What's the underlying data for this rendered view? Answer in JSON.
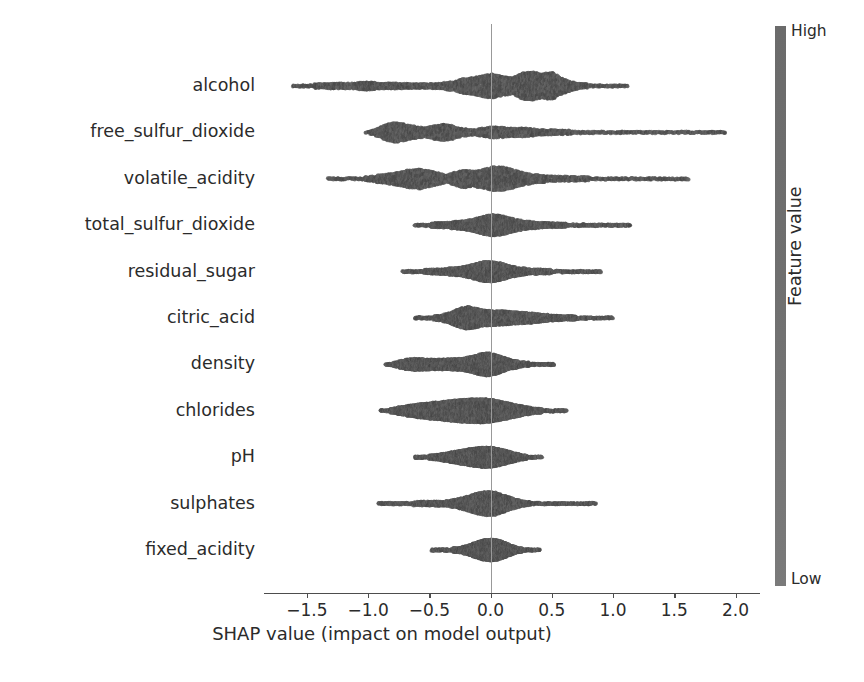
{
  "chart_data": {
    "type": "scatter",
    "plot_variant": "shap-beeswarm",
    "title": "",
    "xlabel": "SHAP value (impact on model output)",
    "ylabel": "",
    "xlim": [
      -1.85,
      2.2
    ],
    "xticks": [
      -1.5,
      -1.0,
      -0.5,
      0.0,
      0.5,
      1.0,
      1.5,
      2.0
    ],
    "xtick_labels": [
      "−1.5",
      "−1.0",
      "−0.5",
      "0.0",
      "0.5",
      "1.0",
      "1.5",
      "2.0"
    ],
    "grid": false,
    "zero_reference_line": 0.0,
    "categories": [
      "alcohol",
      "free_sulfur_dioxide",
      "volatile_acidity",
      "total_sulfur_dioxide",
      "residual_sugar",
      "citric_acid",
      "density",
      "chlorides",
      "pH",
      "sulphates",
      "fixed_acidity"
    ],
    "colorbar": {
      "title": "Feature value",
      "high_label": "High",
      "low_label": "Low",
      "low_color": "#7a7a7a",
      "high_color": "#6b6b6b",
      "position": "right"
    },
    "dot_color": "#595959",
    "series": [
      {
        "name": "alcohol",
        "x_range": [
          -1.62,
          1.12
        ],
        "density_profile": [
          [
            -1.62,
            0.03
          ],
          [
            -1.5,
            0.1
          ],
          [
            -1.38,
            0.17
          ],
          [
            -1.26,
            0.22
          ],
          [
            -1.14,
            0.2
          ],
          [
            -1.02,
            0.26
          ],
          [
            -0.9,
            0.22
          ],
          [
            -0.78,
            0.2
          ],
          [
            -0.66,
            0.17
          ],
          [
            -0.54,
            0.16
          ],
          [
            -0.42,
            0.19
          ],
          [
            -0.3,
            0.3
          ],
          [
            -0.22,
            0.47
          ],
          [
            -0.14,
            0.52
          ],
          [
            -0.06,
            0.66
          ],
          [
            0.02,
            0.74
          ],
          [
            0.1,
            0.58
          ],
          [
            0.18,
            0.52
          ],
          [
            0.26,
            0.8
          ],
          [
            0.34,
            0.86
          ],
          [
            0.42,
            0.74
          ],
          [
            0.5,
            0.84
          ],
          [
            0.58,
            0.5
          ],
          [
            0.66,
            0.3
          ],
          [
            0.74,
            0.18
          ],
          [
            0.84,
            0.1
          ],
          [
            0.95,
            0.04
          ],
          [
            1.05,
            0.07
          ],
          [
            1.12,
            0.04
          ]
        ]
      },
      {
        "name": "free_sulfur_dioxide",
        "x_range": [
          -1.02,
          1.92
        ],
        "density_profile": [
          [
            -1.02,
            0.05
          ],
          [
            -0.92,
            0.28
          ],
          [
            -0.85,
            0.5
          ],
          [
            -0.78,
            0.62
          ],
          [
            -0.7,
            0.52
          ],
          [
            -0.62,
            0.4
          ],
          [
            -0.54,
            0.3
          ],
          [
            -0.46,
            0.42
          ],
          [
            -0.38,
            0.52
          ],
          [
            -0.3,
            0.42
          ],
          [
            -0.22,
            0.24
          ],
          [
            -0.14,
            0.2
          ],
          [
            -0.06,
            0.28
          ],
          [
            0.02,
            0.36
          ],
          [
            0.1,
            0.32
          ],
          [
            0.18,
            0.28
          ],
          [
            0.26,
            0.3
          ],
          [
            0.34,
            0.24
          ],
          [
            0.42,
            0.2
          ],
          [
            0.52,
            0.17
          ],
          [
            0.64,
            0.14
          ],
          [
            0.78,
            0.12
          ],
          [
            0.92,
            0.1
          ],
          [
            1.08,
            0.09
          ],
          [
            1.24,
            0.08
          ],
          [
            1.4,
            0.07
          ],
          [
            1.56,
            0.06
          ],
          [
            1.7,
            0.05
          ],
          [
            1.82,
            0.05
          ],
          [
            1.92,
            0.04
          ]
        ]
      },
      {
        "name": "volatile_acidity",
        "x_range": [
          -1.33,
          1.62
        ],
        "density_profile": [
          [
            -1.33,
            0.03
          ],
          [
            -1.18,
            0.04
          ],
          [
            -1.06,
            0.1
          ],
          [
            -0.96,
            0.2
          ],
          [
            -0.86,
            0.3
          ],
          [
            -0.76,
            0.42
          ],
          [
            -0.66,
            0.56
          ],
          [
            -0.58,
            0.62
          ],
          [
            -0.5,
            0.5
          ],
          [
            -0.42,
            0.36
          ],
          [
            -0.36,
            0.26
          ],
          [
            -0.3,
            0.4
          ],
          [
            -0.22,
            0.56
          ],
          [
            -0.14,
            0.48
          ],
          [
            -0.06,
            0.58
          ],
          [
            0.02,
            0.74
          ],
          [
            0.1,
            0.72
          ],
          [
            0.18,
            0.58
          ],
          [
            0.26,
            0.42
          ],
          [
            0.34,
            0.3
          ],
          [
            0.42,
            0.24
          ],
          [
            0.52,
            0.2
          ],
          [
            0.64,
            0.17
          ],
          [
            0.78,
            0.14
          ],
          [
            0.92,
            0.12
          ],
          [
            1.06,
            0.09
          ],
          [
            1.18,
            0.07
          ],
          [
            1.3,
            0.07
          ],
          [
            1.42,
            0.06
          ],
          [
            1.54,
            0.04
          ],
          [
            1.62,
            0.04
          ]
        ]
      },
      {
        "name": "total_sulfur_dioxide",
        "x_range": [
          -0.62,
          1.14
        ],
        "density_profile": [
          [
            -0.62,
            0.05
          ],
          [
            -0.54,
            0.1
          ],
          [
            -0.46,
            0.16
          ],
          [
            -0.38,
            0.2
          ],
          [
            -0.3,
            0.24
          ],
          [
            -0.22,
            0.3
          ],
          [
            -0.14,
            0.4
          ],
          [
            -0.06,
            0.56
          ],
          [
            0.02,
            0.66
          ],
          [
            0.1,
            0.58
          ],
          [
            0.18,
            0.42
          ],
          [
            0.26,
            0.3
          ],
          [
            0.34,
            0.24
          ],
          [
            0.42,
            0.2
          ],
          [
            0.52,
            0.16
          ],
          [
            0.64,
            0.13
          ],
          [
            0.76,
            0.1
          ],
          [
            0.88,
            0.08
          ],
          [
            1.0,
            0.06
          ],
          [
            1.1,
            0.05
          ],
          [
            1.14,
            0.04
          ]
        ]
      },
      {
        "name": "residual_sugar",
        "x_range": [
          -0.72,
          0.9
        ],
        "density_profile": [
          [
            -0.72,
            0.05
          ],
          [
            -0.64,
            0.09
          ],
          [
            -0.56,
            0.13
          ],
          [
            -0.48,
            0.16
          ],
          [
            -0.4,
            0.2
          ],
          [
            -0.32,
            0.24
          ],
          [
            -0.24,
            0.3
          ],
          [
            -0.16,
            0.42
          ],
          [
            -0.08,
            0.58
          ],
          [
            0.0,
            0.64
          ],
          [
            0.08,
            0.54
          ],
          [
            0.16,
            0.38
          ],
          [
            0.24,
            0.26
          ],
          [
            0.32,
            0.2
          ],
          [
            0.42,
            0.16
          ],
          [
            0.54,
            0.12
          ],
          [
            0.66,
            0.08
          ],
          [
            0.78,
            0.04
          ],
          [
            0.86,
            0.05
          ],
          [
            0.9,
            0.04
          ]
        ]
      },
      {
        "name": "citric_acid",
        "x_range": [
          -0.62,
          1.0
        ],
        "density_profile": [
          [
            -0.62,
            0.04
          ],
          [
            -0.54,
            0.08
          ],
          [
            -0.46,
            0.14
          ],
          [
            -0.38,
            0.24
          ],
          [
            -0.3,
            0.44
          ],
          [
            -0.24,
            0.62
          ],
          [
            -0.18,
            0.7
          ],
          [
            -0.12,
            0.6
          ],
          [
            -0.06,
            0.5
          ],
          [
            0.02,
            0.48
          ],
          [
            0.1,
            0.44
          ],
          [
            0.18,
            0.4
          ],
          [
            0.26,
            0.36
          ],
          [
            0.34,
            0.32
          ],
          [
            0.42,
            0.26
          ],
          [
            0.52,
            0.2
          ],
          [
            0.62,
            0.16
          ],
          [
            0.72,
            0.13
          ],
          [
            0.82,
            0.1
          ],
          [
            0.92,
            0.07
          ],
          [
            1.0,
            0.05
          ]
        ]
      },
      {
        "name": "density",
        "x_range": [
          -0.86,
          0.52
        ],
        "density_profile": [
          [
            -0.86,
            0.04
          ],
          [
            -0.78,
            0.16
          ],
          [
            -0.7,
            0.32
          ],
          [
            -0.62,
            0.4
          ],
          [
            -0.54,
            0.36
          ],
          [
            -0.46,
            0.32
          ],
          [
            -0.38,
            0.34
          ],
          [
            -0.3,
            0.36
          ],
          [
            -0.22,
            0.4
          ],
          [
            -0.14,
            0.52
          ],
          [
            -0.08,
            0.66
          ],
          [
            -0.02,
            0.7
          ],
          [
            0.04,
            0.62
          ],
          [
            0.1,
            0.46
          ],
          [
            0.16,
            0.32
          ],
          [
            0.24,
            0.2
          ],
          [
            0.32,
            0.13
          ],
          [
            0.4,
            0.08
          ],
          [
            0.48,
            0.05
          ],
          [
            0.52,
            0.04
          ]
        ]
      },
      {
        "name": "chlorides",
        "x_range": [
          -0.9,
          0.62
        ],
        "density_profile": [
          [
            -0.9,
            0.05
          ],
          [
            -0.82,
            0.14
          ],
          [
            -0.74,
            0.26
          ],
          [
            -0.66,
            0.36
          ],
          [
            -0.58,
            0.44
          ],
          [
            -0.5,
            0.5
          ],
          [
            -0.42,
            0.56
          ],
          [
            -0.34,
            0.62
          ],
          [
            -0.26,
            0.68
          ],
          [
            -0.18,
            0.72
          ],
          [
            -0.1,
            0.74
          ],
          [
            -0.02,
            0.72
          ],
          [
            0.06,
            0.62
          ],
          [
            0.14,
            0.5
          ],
          [
            0.22,
            0.38
          ],
          [
            0.3,
            0.26
          ],
          [
            0.38,
            0.17
          ],
          [
            0.46,
            0.11
          ],
          [
            0.54,
            0.07
          ],
          [
            0.62,
            0.05
          ]
        ]
      },
      {
        "name": "pH",
        "x_range": [
          -0.62,
          0.42
        ],
        "density_profile": [
          [
            -0.62,
            0.04
          ],
          [
            -0.54,
            0.1
          ],
          [
            -0.46,
            0.18
          ],
          [
            -0.38,
            0.26
          ],
          [
            -0.3,
            0.36
          ],
          [
            -0.22,
            0.46
          ],
          [
            -0.14,
            0.56
          ],
          [
            -0.06,
            0.62
          ],
          [
            0.02,
            0.6
          ],
          [
            0.1,
            0.48
          ],
          [
            0.18,
            0.32
          ],
          [
            0.26,
            0.18
          ],
          [
            0.34,
            0.09
          ],
          [
            0.42,
            0.05
          ]
        ]
      },
      {
        "name": "sulphates",
        "x_range": [
          -0.92,
          0.86
        ],
        "density_profile": [
          [
            -0.92,
            0.06
          ],
          [
            -0.84,
            0.09
          ],
          [
            -0.76,
            0.11
          ],
          [
            -0.66,
            0.13
          ],
          [
            -0.56,
            0.15
          ],
          [
            -0.46,
            0.17
          ],
          [
            -0.36,
            0.2
          ],
          [
            -0.28,
            0.28
          ],
          [
            -0.2,
            0.44
          ],
          [
            -0.12,
            0.62
          ],
          [
            -0.04,
            0.74
          ],
          [
            0.04,
            0.7
          ],
          [
            0.12,
            0.5
          ],
          [
            0.2,
            0.3
          ],
          [
            0.28,
            0.17
          ],
          [
            0.36,
            0.11
          ],
          [
            0.46,
            0.07
          ],
          [
            0.58,
            0.04
          ],
          [
            0.78,
            0.05
          ],
          [
            0.84,
            0.05
          ]
        ]
      },
      {
        "name": "fixed_acidity",
        "x_range": [
          -0.48,
          0.4
        ],
        "density_profile": [
          [
            -0.48,
            0.05
          ],
          [
            -0.42,
            0.08
          ],
          [
            -0.36,
            0.11
          ],
          [
            -0.3,
            0.14
          ],
          [
            -0.24,
            0.2
          ],
          [
            -0.18,
            0.32
          ],
          [
            -0.12,
            0.48
          ],
          [
            -0.06,
            0.62
          ],
          [
            0.0,
            0.68
          ],
          [
            0.06,
            0.62
          ],
          [
            0.12,
            0.46
          ],
          [
            0.18,
            0.28
          ],
          [
            0.24,
            0.16
          ],
          [
            0.3,
            0.09
          ],
          [
            0.36,
            0.06
          ],
          [
            0.4,
            0.04
          ]
        ]
      }
    ]
  }
}
